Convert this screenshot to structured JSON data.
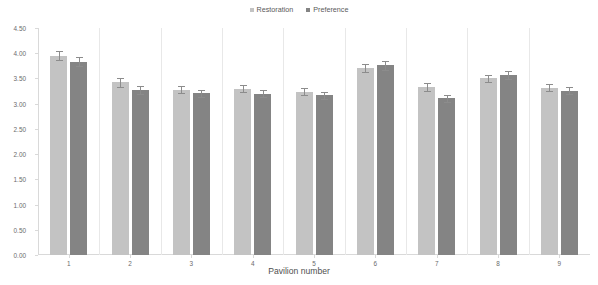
{
  "chart_data": {
    "type": "bar",
    "title": "",
    "xlabel": "Pavilion number",
    "ylabel": "",
    "categories": [
      "1",
      "2",
      "3",
      "4",
      "5",
      "6",
      "7",
      "8",
      "9"
    ],
    "ylim": [
      0,
      4.5
    ],
    "ytick_labels": [
      "0.00",
      "0.50",
      "1.00",
      "1.50",
      "2.00",
      "2.50",
      "3.00",
      "3.50",
      "4.00",
      "4.50"
    ],
    "ytick_values": [
      0,
      0.5,
      1,
      1.5,
      2,
      2.5,
      3,
      3.5,
      4,
      4.5
    ],
    "grid": false,
    "legend_position": "top-center",
    "series": [
      {
        "name": "Restoration",
        "color": "#c3c3c3",
        "values": [
          3.95,
          3.42,
          3.28,
          3.3,
          3.24,
          3.7,
          3.33,
          3.5,
          3.32
        ],
        "errors": [
          0.09,
          0.08,
          0.07,
          0.07,
          0.07,
          0.08,
          0.07,
          0.07,
          0.07
        ]
      },
      {
        "name": "Preference",
        "color": "#848484",
        "values": [
          3.83,
          3.28,
          3.21,
          3.2,
          3.17,
          3.76,
          3.11,
          3.56,
          3.26
        ],
        "errors": [
          0.09,
          0.08,
          0.07,
          0.07,
          0.07,
          0.09,
          0.07,
          0.08,
          0.07
        ]
      }
    ]
  },
  "legend": {
    "items": [
      {
        "label": "Restoration",
        "color": "#c3c3c3"
      },
      {
        "label": "Preference",
        "color": "#848484"
      }
    ]
  },
  "axis": {
    "x_title": "Pavilion number"
  }
}
